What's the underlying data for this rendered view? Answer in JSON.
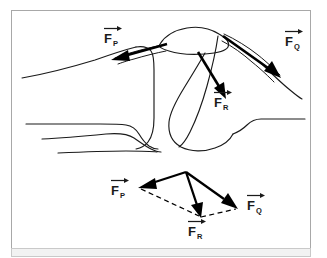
{
  "figure": {
    "panel": {
      "background_color": "#ffffff",
      "border_color": "#a8a8a8",
      "footer_band_color": "#f2f2f2"
    },
    "ink_color": "#1a1a1a",
    "arrow_color": "#000000"
  },
  "anatomy_diagram": {
    "name": "knee-joint-sagittal-outline",
    "parts": [
      {
        "name": "femur-shaft-superior-border",
        "label": ""
      },
      {
        "name": "femoral-condyle",
        "label": ""
      },
      {
        "name": "patella",
        "label": ""
      },
      {
        "name": "quadriceps-tendon",
        "label": ""
      },
      {
        "name": "patellar-ligament",
        "label": ""
      },
      {
        "name": "tibia-plateau",
        "label": ""
      },
      {
        "name": "fibula",
        "label": ""
      }
    ]
  },
  "force_vectors": {
    "fp": {
      "symbol": "F",
      "subscript": "P",
      "name": "quadriceps-tendon-force",
      "direction": "up-left"
    },
    "fq": {
      "symbol": "F",
      "subscript": "Q",
      "name": "patellar-ligament-force",
      "direction": "down-right"
    },
    "fr": {
      "symbol": "F",
      "subscript": "R",
      "name": "resultant-joint-reaction-force",
      "direction": "down"
    }
  },
  "vector_parallelogram": {
    "name": "force-parallelogram",
    "description": "Parallelogram construction showing F_P and F_Q summing to resultant F_R",
    "labels": {
      "fp": {
        "symbol": "F",
        "subscript": "P"
      },
      "fq": {
        "symbol": "F",
        "subscript": "Q"
      },
      "fr": {
        "symbol": "F",
        "subscript": "R"
      }
    },
    "geometry": {
      "apex": [
        186,
        172
      ],
      "fp_tip": [
        139,
        187
      ],
      "fq_tip": [
        238,
        209
      ],
      "fr_tip": [
        200,
        218
      ]
    }
  }
}
